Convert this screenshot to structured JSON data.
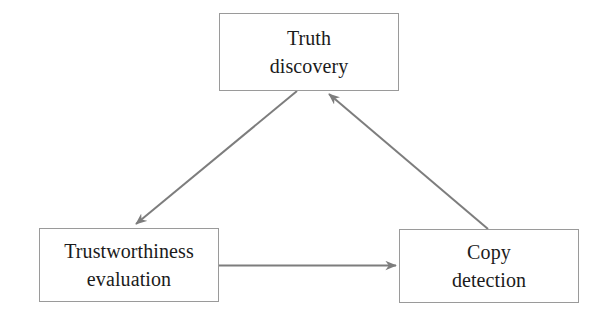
{
  "diagram": {
    "background_color": "#ffffff",
    "node_border_color": "#9a9a9a",
    "edge_color": "#7d7d7d",
    "text_color": "#1b1b1b",
    "nodes": [
      {
        "id": "truth-discovery",
        "label": "Truth\ndiscovery",
        "line1": "Truth",
        "line2": "discovery"
      },
      {
        "id": "trustworthiness-evaluation",
        "label": "Trustworthiness\nevaluation",
        "line1": "Trustworthiness",
        "line2": "evaluation"
      },
      {
        "id": "copy-detection",
        "label": "Copy\ndetection",
        "line1": "Copy",
        "line2": "detection"
      }
    ],
    "edges": [
      {
        "id": "truth-to-trustworthiness",
        "from": "truth-discovery",
        "to": "trustworthiness-evaluation",
        "direction": "one-way",
        "arrowhead": "end"
      },
      {
        "id": "trustworthiness-to-copy",
        "from": "trustworthiness-evaluation",
        "to": "copy-detection",
        "direction": "one-way",
        "arrowhead": "end"
      },
      {
        "id": "copy-to-truth",
        "from": "copy-detection",
        "to": "truth-discovery",
        "direction": "one-way",
        "arrowhead": "end"
      }
    ]
  }
}
